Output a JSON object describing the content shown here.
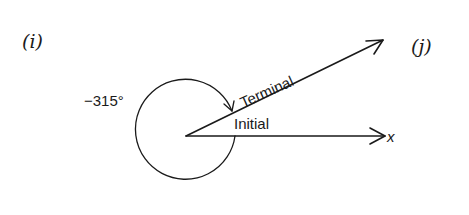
{
  "figure": {
    "panel_left_label": "(i)",
    "panel_right_label": "(j)",
    "angle_label": "−315°",
    "terminal_label": "Terminal",
    "initial_label": "Initial",
    "axis_label": "x",
    "angle_degrees": -315,
    "rotation_direction": "clockwise",
    "colors": {
      "ink": "#1a1a1a",
      "background": "#ffffff"
    }
  }
}
